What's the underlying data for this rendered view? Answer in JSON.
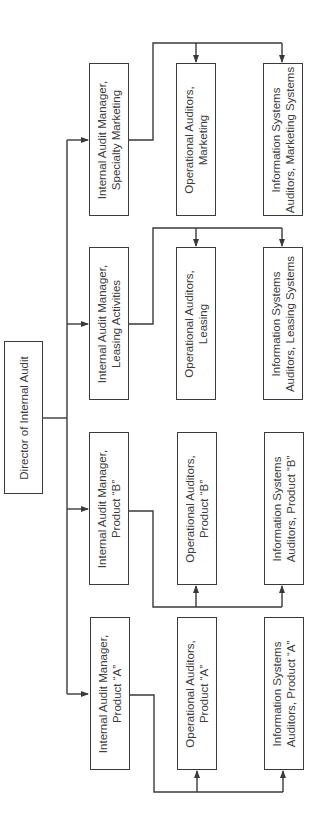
{
  "diagram": {
    "type": "org-chart",
    "orientation": "rotated-90-ccw",
    "root": {
      "id": "director",
      "lines": [
        "Director of Internal Audit"
      ]
    },
    "managers": [
      {
        "id": "mgr-specialty-marketing",
        "lines": [
          "Internal Audit Manager,",
          "Specialty Marketing"
        ],
        "reports": [
          {
            "id": "ops-marketing",
            "lines": [
              "Operational Auditors,",
              "Marketing"
            ]
          },
          {
            "id": "is-marketing",
            "lines": [
              "Information Systems",
              "Auditors, Marketing Systems"
            ]
          }
        ]
      },
      {
        "id": "mgr-leasing",
        "lines": [
          "Internal Audit Manager,",
          "Leasing Activities"
        ],
        "reports": [
          {
            "id": "ops-leasing",
            "lines": [
              "Operational Auditors,",
              "Leasing"
            ]
          },
          {
            "id": "is-leasing",
            "lines": [
              "Information Systems",
              "Auditors, Leasing Systems"
            ]
          }
        ]
      },
      {
        "id": "mgr-product-b",
        "lines": [
          "Internal Audit Manager,",
          "Product “B”"
        ],
        "reports": [
          {
            "id": "ops-product-b",
            "lines": [
              "Operational Auditors,",
              "Product “B”"
            ]
          },
          {
            "id": "is-product-b",
            "lines": [
              "Information Systems",
              "Auditors, Product “B”"
            ]
          }
        ]
      },
      {
        "id": "mgr-product-a",
        "lines": [
          "Internal Audit Manager,",
          "Product “A”"
        ],
        "reports": [
          {
            "id": "ops-product-a",
            "lines": [
              "Operational Auditors,",
              "Product “A”"
            ]
          },
          {
            "id": "is-product-a",
            "lines": [
              "Information Systems",
              "Auditors, Product “A”"
            ]
          }
        ]
      }
    ],
    "colors": {
      "line": "#3a3a3a",
      "text": "#3c3c3c",
      "background": "#ffffff"
    }
  }
}
